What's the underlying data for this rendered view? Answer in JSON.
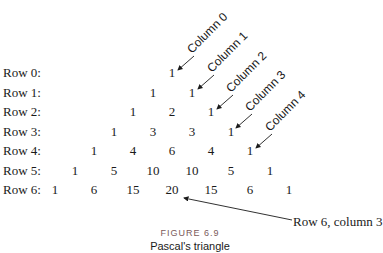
{
  "figure": {
    "number": "FIGURE 6.9",
    "caption": "Pascal's triangle"
  },
  "rows": [
    {
      "label": "Row 0:",
      "values": [
        "1"
      ]
    },
    {
      "label": "Row 1:",
      "values": [
        "1",
        "1"
      ]
    },
    {
      "label": "Row 2:",
      "values": [
        "1",
        "2",
        "1"
      ]
    },
    {
      "label": "Row 3:",
      "values": [
        "1",
        "3",
        "3",
        "1"
      ]
    },
    {
      "label": "Row 4:",
      "values": [
        "1",
        "4",
        "6",
        "4",
        "1"
      ]
    },
    {
      "label": "Row 5:",
      "values": [
        "1",
        "5",
        "10",
        "10",
        "5",
        "1"
      ]
    },
    {
      "label": "Row 6:",
      "values": [
        "1",
        "6",
        "15",
        "20",
        "15",
        "6",
        "1"
      ]
    }
  ],
  "column_labels": [
    "Column 0",
    "Column 1",
    "Column 2",
    "Column 3",
    "Column 4"
  ],
  "callout": "Row 6, column 3"
}
